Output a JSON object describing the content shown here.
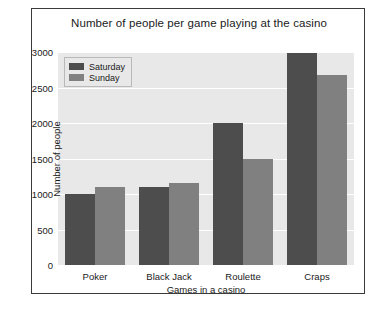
{
  "chart_data": {
    "type": "bar",
    "title": "Number of people per game playing at the casino",
    "xlabel": "Games in a casino",
    "ylabel": "Number of people",
    "categories": [
      "Poker",
      "Black Jack",
      "Roulette",
      "Craps"
    ],
    "series": [
      {
        "name": "Saturday",
        "color": "#4d4d4d",
        "values": [
          1000,
          1100,
          2000,
          2980
        ]
      },
      {
        "name": "Sunday",
        "color": "#808080",
        "values": [
          1100,
          1150,
          1500,
          2680
        ]
      }
    ],
    "ylim": [
      0,
      3000
    ],
    "yticks": [
      0,
      500,
      1000,
      1500,
      2000,
      2500,
      3000
    ],
    "ytick_labels": [
      "0",
      "500",
      "1000",
      "1500",
      "2000",
      "2500",
      "3000"
    ],
    "grid": true,
    "legend_position": "upper left",
    "plot_background": "#e8e8e8",
    "gridline_color": "#ffffff",
    "figure_background": "#ffffff"
  }
}
